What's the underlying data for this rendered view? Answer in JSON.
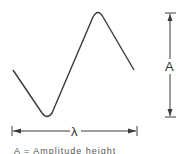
{
  "diagram": {
    "type": "waveform",
    "stroke_color": "#3a3a3a",
    "labels": {
      "amplitude": "A",
      "wavelength": "λ"
    },
    "caption": "A = Amplitude height"
  }
}
